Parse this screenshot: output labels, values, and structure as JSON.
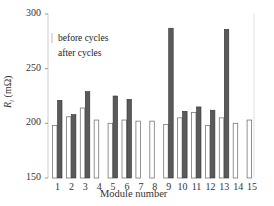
{
  "chart_data": {
    "type": "bar",
    "title": "",
    "xlabel": "Module number",
    "ylabel": "R_i (mΩ)",
    "ylim": [
      150,
      300
    ],
    "yticks": [
      150,
      200,
      250,
      300
    ],
    "grid": false,
    "legend_position": "upper-left",
    "categories": [
      "1",
      "2",
      "3",
      "4",
      "5",
      "6",
      "7",
      "8",
      "9",
      "10",
      "11",
      "12",
      "13",
      "14",
      "15"
    ],
    "series": [
      {
        "name": "before cycles",
        "style": "white-fill-outline",
        "values": [
          198,
          206,
          214,
          203,
          200,
          203,
          202,
          202,
          199,
          205,
          210,
          198,
          205,
          200,
          203
        ]
      },
      {
        "name": "after cycles",
        "style": "dark-gray-fill",
        "values": [
          221,
          208,
          229,
          null,
          225,
          222,
          null,
          null,
          287,
          211,
          215,
          212,
          286,
          null,
          null
        ]
      }
    ],
    "colors": {
      "before": "#ffffff",
      "before_outline": "#777777",
      "after": "#5a5a5a",
      "axis": "#cccccc"
    }
  },
  "labels": {
    "ylabel_main": "R",
    "ylabel_sub": "i",
    "ylabel_unit": " (mΩ)",
    "xlabel": "Module number",
    "legend_before": "before cycles",
    "legend_after": "after cycles"
  }
}
